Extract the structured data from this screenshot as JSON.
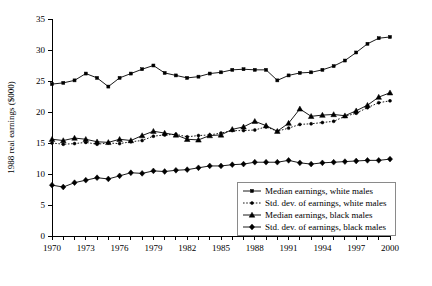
{
  "chart_data": {
    "type": "line",
    "title": "",
    "xlabel": "",
    "ylabel": "1988 real earnings ($000)",
    "xlim": [
      1970,
      2000
    ],
    "ylim": [
      0,
      35
    ],
    "yticks": [
      0,
      5,
      10,
      15,
      20,
      25,
      30,
      35
    ],
    "xticks": [
      1970,
      1971,
      1972,
      1973,
      1974,
      1975,
      1976,
      1977,
      1978,
      1979,
      1980,
      1981,
      1982,
      1983,
      1984,
      1985,
      1986,
      1987,
      1988,
      1989,
      1990,
      1991,
      1992,
      1993,
      1994,
      1995,
      1996,
      1997,
      1998,
      1999,
      2000
    ],
    "xtick_labels_shown": [
      "1970",
      "1973",
      "1976",
      "1979",
      "1982",
      "1985",
      "1988",
      "1991",
      "1994",
      "1997",
      "2000"
    ],
    "grid": false,
    "legend_position": "bottom-right",
    "x": [
      1970,
      1971,
      1972,
      1973,
      1974,
      1975,
      1976,
      1977,
      1978,
      1979,
      1980,
      1981,
      1982,
      1983,
      1984,
      1985,
      1986,
      1987,
      1988,
      1989,
      1990,
      1991,
      1992,
      1993,
      1994,
      1995,
      1996,
      1997,
      1998,
      1999,
      2000
    ],
    "series": [
      {
        "name": "Median earnings, white males",
        "marker": "square",
        "linestyle": "solid",
        "values": [
          24.5,
          24.7,
          25.1,
          26.2,
          25.5,
          24.1,
          25.5,
          26.2,
          26.9,
          27.5,
          26.3,
          25.9,
          25.5,
          25.7,
          26.2,
          26.4,
          26.8,
          26.9,
          26.8,
          26.8,
          25.1,
          25.9,
          26.3,
          26.4,
          26.8,
          27.4,
          28.3,
          29.6,
          31.0,
          31.9,
          32.1
        ]
      },
      {
        "name": "Std. dev. of earnings, white males",
        "marker": "dot",
        "linestyle": "dotted",
        "values": [
          15.0,
          14.8,
          14.9,
          15.1,
          14.8,
          15.0,
          14.9,
          15.2,
          15.4,
          16.1,
          16.3,
          16.4,
          16.0,
          16.2,
          16.3,
          16.6,
          17.0,
          17.0,
          17.1,
          17.6,
          16.9,
          17.4,
          18.0,
          18.1,
          18.3,
          18.5,
          19.3,
          19.8,
          20.7,
          21.5,
          21.8
        ]
      },
      {
        "name": "Median earnings, black males",
        "marker": "triangle",
        "linestyle": "solid",
        "values": [
          15.6,
          15.4,
          15.8,
          15.6,
          15.2,
          15.1,
          15.6,
          15.4,
          16.2,
          16.9,
          16.6,
          16.3,
          15.6,
          15.5,
          16.2,
          16.3,
          17.2,
          17.6,
          18.5,
          17.8,
          16.9,
          18.2,
          20.5,
          19.3,
          19.5,
          19.6,
          19.4,
          20.2,
          21.1,
          22.4,
          23.1
        ]
      },
      {
        "name": "Std. dev. of earnings, black males",
        "marker": "diamond",
        "linestyle": "solid",
        "values": [
          8.2,
          7.9,
          8.6,
          9.0,
          9.4,
          9.2,
          9.7,
          10.2,
          10.1,
          10.5,
          10.4,
          10.6,
          10.7,
          11.0,
          11.3,
          11.3,
          11.5,
          11.6,
          11.9,
          11.9,
          11.9,
          12.2,
          11.8,
          11.6,
          11.8,
          11.9,
          12.0,
          12.1,
          12.2,
          12.2,
          12.4
        ]
      }
    ]
  },
  "legend": {
    "items": [
      {
        "label": "Median earnings, white males"
      },
      {
        "label": "Std. dev. of earnings, white males"
      },
      {
        "label": "Median earnings, black males"
      },
      {
        "label": "Std. dev. of earnings, black males"
      }
    ]
  },
  "colors": {
    "ink": "#000000",
    "legend_border": "#8a8a8a",
    "background": "#ffffff"
  }
}
